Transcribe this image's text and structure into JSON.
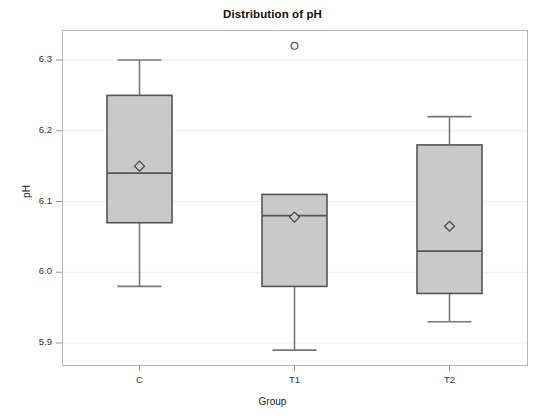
{
  "chart_data": {
    "type": "box",
    "title": "Distribution of pH",
    "xlabel": "Group",
    "ylabel": "pH",
    "categories": [
      "C",
      "T1",
      "T2"
    ],
    "ytick_labels": [
      "6.3",
      "6.2",
      "6.1",
      "6.0",
      "5.9"
    ],
    "ytick_values": [
      6.3,
      6.2,
      6.1,
      6.0,
      5.9
    ],
    "ylim": [
      5.86,
      6.34
    ],
    "grid": "horizontal",
    "legend": "none",
    "box_fill_color": "#c9c9c9",
    "box_line_color": "#555555",
    "whisker_color": "#777777",
    "frame_color": "#b8b8b8",
    "gridline_color": "#eeeeee",
    "series": [
      {
        "name": "C",
        "whisker_low": 5.98,
        "q1": 6.07,
        "median": 6.14,
        "q3": 6.25,
        "whisker_high": 6.3,
        "mean": 6.15,
        "outliers": []
      },
      {
        "name": "T1",
        "whisker_low": 5.89,
        "q1": 5.98,
        "median": 6.08,
        "q3": 6.11,
        "whisker_high": 6.11,
        "mean": 6.078,
        "outliers": [
          6.32
        ]
      },
      {
        "name": "T2",
        "whisker_low": 5.93,
        "q1": 5.97,
        "median": 6.03,
        "q3": 6.18,
        "whisker_high": 6.22,
        "mean": 6.065,
        "outliers": []
      }
    ]
  },
  "title": "Distribution of pH",
  "axis": {
    "y_title": "pH",
    "x_title": "Group"
  },
  "yticks": [
    {
      "label": "6.3"
    },
    {
      "label": "6.2"
    },
    {
      "label": "6.1"
    },
    {
      "label": "6.0"
    },
    {
      "label": "5.9"
    }
  ],
  "xticks": [
    {
      "label": "C"
    },
    {
      "label": "T1"
    },
    {
      "label": "T2"
    }
  ]
}
